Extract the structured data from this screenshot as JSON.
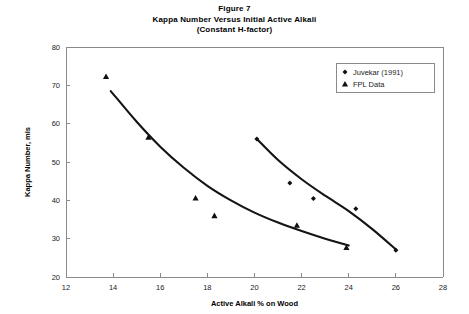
{
  "figure": {
    "title_lines": [
      "Figure 7",
      "Kappa Number Versus Initial Active Alkali",
      "(Constant H-factor)"
    ]
  },
  "legend": {
    "entries": [
      {
        "label": "Juvekar (1991)",
        "marker": "diamond-marker"
      },
      {
        "label": "FPL Data",
        "marker": "triangle-marker"
      }
    ]
  },
  "axes": {
    "x_title": "Active Alkali % on Wood",
    "y_title": "Kappa Number, mls",
    "x_ticks": [
      "12",
      "14",
      "16",
      "18",
      "20",
      "22",
      "24",
      "26",
      "28"
    ],
    "y_ticks": [
      "20",
      "30",
      "40",
      "50",
      "60",
      "70",
      "80"
    ]
  },
  "chart_data": {
    "type": "scatter",
    "xlabel": "Active Alkali % on Wood",
    "ylabel": "Kappa Number, mls",
    "xlim": [
      12,
      28
    ],
    "ylim": [
      20,
      80
    ],
    "xticks": [
      12,
      14,
      16,
      18,
      20,
      22,
      24,
      26,
      28
    ],
    "yticks": [
      20,
      30,
      40,
      50,
      60,
      70,
      80
    ],
    "grid": false,
    "legend_position": "upper right",
    "series": [
      {
        "name": "Juvekar (1991)",
        "marker": "diamond",
        "points": [
          {
            "x": 20.1,
            "y": 56.0
          },
          {
            "x": 21.5,
            "y": 44.5
          },
          {
            "x": 22.5,
            "y": 40.5
          },
          {
            "x": 24.3,
            "y": 37.8
          },
          {
            "x": 26.0,
            "y": 27.0
          }
        ],
        "fit_curve": [
          {
            "x": 20.1,
            "y": 56.0
          },
          {
            "x": 21.0,
            "y": 50.5
          },
          {
            "x": 22.0,
            "y": 45.5
          },
          {
            "x": 23.0,
            "y": 41.2
          },
          {
            "x": 24.0,
            "y": 37.2
          },
          {
            "x": 25.0,
            "y": 32.5
          },
          {
            "x": 26.0,
            "y": 27.2
          }
        ]
      },
      {
        "name": "FPL Data",
        "marker": "triangle",
        "points": [
          {
            "x": 13.7,
            "y": 72.3
          },
          {
            "x": 15.5,
            "y": 56.5
          },
          {
            "x": 17.5,
            "y": 40.6
          },
          {
            "x": 18.3,
            "y": 36.0
          },
          {
            "x": 21.8,
            "y": 33.5
          },
          {
            "x": 23.9,
            "y": 27.7
          }
        ],
        "fit_curve": [
          {
            "x": 13.9,
            "y": 68.5
          },
          {
            "x": 15.0,
            "y": 60.5
          },
          {
            "x": 16.0,
            "y": 54.0
          },
          {
            "x": 17.0,
            "y": 48.5
          },
          {
            "x": 18.0,
            "y": 43.8
          },
          {
            "x": 19.0,
            "y": 40.0
          },
          {
            "x": 20.0,
            "y": 36.8
          },
          {
            "x": 21.0,
            "y": 34.2
          },
          {
            "x": 22.0,
            "y": 32.0
          },
          {
            "x": 23.0,
            "y": 30.0
          },
          {
            "x": 24.0,
            "y": 28.2
          }
        ]
      }
    ]
  }
}
